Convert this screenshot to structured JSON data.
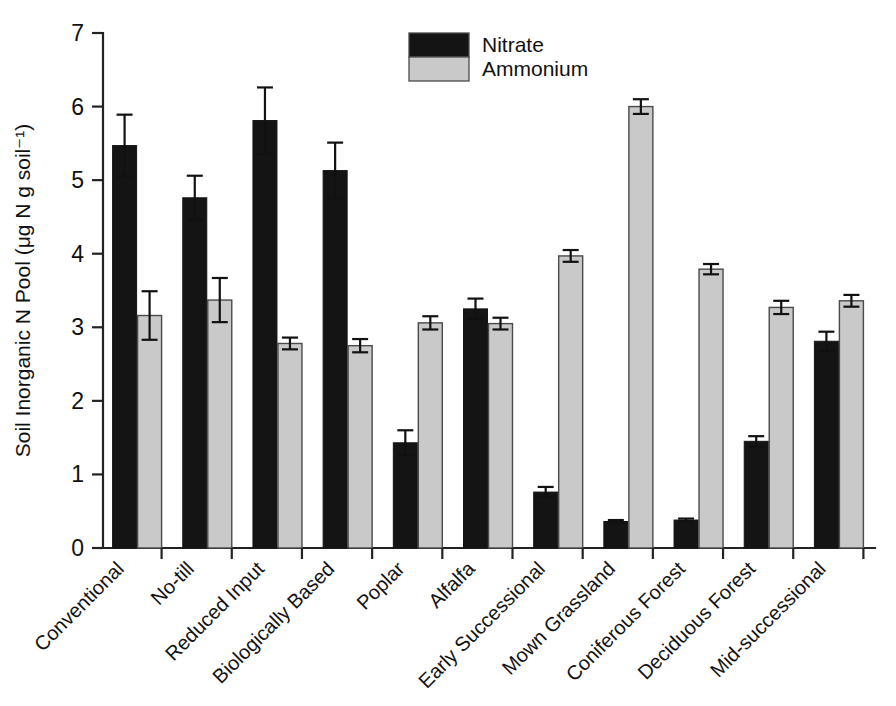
{
  "chart_data": {
    "type": "bar",
    "title": "",
    "xlabel": "",
    "ylabel": "Soil Inorganic N Pool (μg N g soil⁻¹)",
    "ylim": [
      0,
      7
    ],
    "yticks": [
      0,
      1,
      2,
      3,
      4,
      5,
      6,
      7
    ],
    "ytick_labels": [
      "0",
      "1",
      "2",
      "3",
      "4",
      "5",
      "6",
      "7"
    ],
    "grid": false,
    "legend_position": "top-center",
    "categories": [
      "Conventional",
      "No-till",
      "Reduced Input",
      "Biologically Based",
      "Poplar",
      "Alfalfa",
      "Early Successional",
      "Mown Grassland",
      "Coniferous Forest",
      "Deciduous Forest",
      "Mid-successional"
    ],
    "series": [
      {
        "name": "Nitrate",
        "color": "#141414",
        "values": [
          5.47,
          4.76,
          5.81,
          5.13,
          1.43,
          3.25,
          0.76,
          0.36,
          0.38,
          1.45,
          2.81
        ],
        "errors": [
          0.42,
          0.3,
          0.45,
          0.38,
          0.17,
          0.14,
          0.07,
          0.02,
          0.02,
          0.07,
          0.13
        ]
      },
      {
        "name": "Ammonium",
        "color": "#c9c9c9",
        "values": [
          3.16,
          3.37,
          2.78,
          2.75,
          3.06,
          3.05,
          3.97,
          6.0,
          3.79,
          3.27,
          3.36
        ],
        "errors": [
          0.33,
          0.3,
          0.08,
          0.09,
          0.09,
          0.08,
          0.08,
          0.1,
          0.07,
          0.09,
          0.08
        ]
      }
    ]
  },
  "legend": {
    "entries": [
      {
        "label": "Nitrate",
        "swatch": "black-swatch"
      },
      {
        "label": "Ammonium",
        "swatch": "gray-swatch"
      }
    ]
  },
  "colors": {
    "nitrate": "#141414",
    "ammonium": "#c9c9c9",
    "axis": "#222222",
    "background": "#ffffff"
  }
}
